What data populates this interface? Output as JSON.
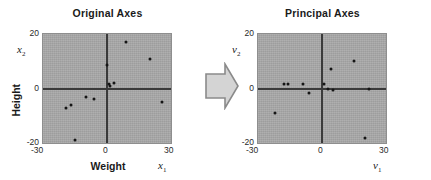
{
  "figure": {
    "panels": [
      {
        "id": "original",
        "title": "Original Axes",
        "x_symbol": "x",
        "x_sub": "1",
        "y_symbol": "x",
        "y_sub": "2",
        "x_name": "Weight",
        "y_name": "Height",
        "xticks": [
          "-30",
          "0",
          "30"
        ],
        "yticks": [
          "20",
          "0",
          "-20"
        ]
      },
      {
        "id": "principal",
        "title": "Principal Axes",
        "x_symbol": "v",
        "x_sub": "1",
        "y_symbol": "v",
        "y_sub": "2",
        "x_name": "",
        "y_name": "",
        "xticks": [
          "-30",
          "0",
          "30"
        ],
        "yticks": [
          "20",
          "0",
          "-20"
        ]
      }
    ],
    "arrow": {
      "name": "transform-arrow",
      "direction": "right",
      "fill": "#d4d4d4",
      "stroke": "#888888"
    },
    "colors": {
      "plot_background": "#a8a8a8",
      "axis_line": "#3a3a3a",
      "point": "#151515",
      "text": "#1a1a1a",
      "page_background": "#ffffff"
    }
  },
  "chart_data": [
    {
      "type": "scatter",
      "title": "Original Axes",
      "xlabel": "Weight",
      "ylabel": "Height",
      "x_axis_symbol": "x1",
      "y_axis_symbol": "x2",
      "xlim": [
        -30,
        30
      ],
      "ylim": [
        -20,
        20
      ],
      "xticks": [
        -30,
        0,
        30
      ],
      "yticks": [
        -20,
        0,
        20
      ],
      "grid": false,
      "legend": false,
      "series": [
        {
          "name": "samples",
          "marker": "filled-circle",
          "color": "#151515",
          "points": [
            [
              9,
              17
            ],
            [
              20,
              11
            ],
            [
              0,
              8.5
            ],
            [
              3.5,
              2
            ],
            [
              1,
              1.5
            ],
            [
              1.5,
              0.8
            ],
            [
              -10,
              -3
            ],
            [
              -6,
              -4
            ],
            [
              -17,
              -6
            ],
            [
              -19,
              -7
            ],
            [
              26,
              -5
            ],
            [
              -15,
              -19
            ]
          ]
        }
      ]
    },
    {
      "type": "scatter",
      "title": "Principal Axes",
      "xlabel": "",
      "ylabel": "",
      "x_axis_symbol": "v1",
      "y_axis_symbol": "v2",
      "xlim": [
        -30,
        30
      ],
      "ylim": [
        -20,
        20
      ],
      "xticks": [
        -30,
        0,
        30
      ],
      "yticks": [
        -20,
        0,
        20
      ],
      "grid": false,
      "legend": false,
      "series": [
        {
          "name": "samples",
          "marker": "filled-circle",
          "color": "#151515",
          "points": [
            [
              15,
              10
            ],
            [
              4,
              7
            ],
            [
              -18,
              1.5
            ],
            [
              -16,
              1.5
            ],
            [
              -9,
              1.5
            ],
            [
              1,
              1.5
            ],
            [
              3,
              0
            ],
            [
              22,
              0
            ],
            [
              5,
              -0.5
            ],
            [
              -6,
              -1.5
            ],
            [
              -22,
              -9
            ],
            [
              20,
              -18
            ]
          ]
        }
      ]
    }
  ]
}
